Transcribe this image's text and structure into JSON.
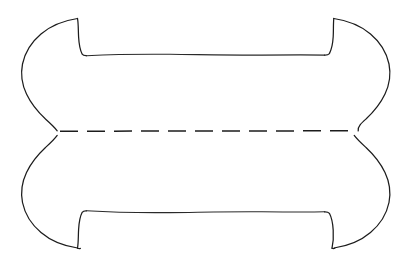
{
  "canvas": {
    "width": 416,
    "height": 271,
    "background_color": "#ffffff",
    "ink_color": "#1c1c1c",
    "stroke_width": 1.25
  },
  "figure": {
    "title": "",
    "symmetry": "bilateral horizontal and vertical",
    "parts": [
      {
        "name": "upper-lobe",
        "label": "Upper lobe outline",
        "ink_color": "#1c1c1c",
        "path": "M 77 18 C 60 21 44 31 33 46 C 23 60 20 70 22 80 C 24 94 32 108 43 118 C 49 124 54 128 57 131 C 54 133 50 135 45 139 C 36 147 29 156 26 165 L 27 166 C 31 154 39 143 49 136 C 53 133 56 131 58 130 L 358 130 C 360 131 363 133 367 136 C 377 143 385 154 389 166 L 390 165 C 387 156 380 147 371 139 C 366 135 362 133 359 131 C 362 128 367 124 373 118 C 384 108 392 94 394 80 C 396 70 393 60 383 46 C 372 31 356 21 339 18 L 338 19 C 340 23 340 30 339 37 C 338 44 336 50 334 54 L 333 55 L 250 55 L 170 55 L 110 55 L 82 55 C 80 51 78 45 77 38 C 76 31 76 23 78 19 Z"
      },
      {
        "name": "upper-left-horn",
        "label": "Upper left horn tip",
        "tip_x": 77,
        "tip_y": 18
      },
      {
        "name": "upper-right-horn",
        "label": "Upper right horn tip",
        "tip_x": 333,
        "tip_y": 18
      },
      {
        "name": "upper-inner-edge",
        "label": "Upper inner horizontal edge",
        "y": 55
      },
      {
        "name": "lower-lobe",
        "label": "Lower lobe outline",
        "ink_color": "#1c1c1c",
        "path": "M 79 248 C 62 245 46 235 35 220 C 25 206 22 196 24 186 C 26 172 34 158 45 148 C 51 142 56 138 59 135 L 357 135 C 360 138 365 142 371 148 C 382 158 390 172 392 186 C 394 196 391 206 381 220 C 370 235 354 245 337 248 L 336 247 C 338 243 338 236 337 229 C 336 222 334 216 332 212 L 331 211 L 250 211 L 170 211 L 110 211 L 84 211 C 82 215 80 221 79 228 C 78 235 78 243 80 247 Z"
      },
      {
        "name": "lower-left-horn",
        "label": "Lower left horn tip",
        "tip_x": 79,
        "tip_y": 248
      },
      {
        "name": "lower-right-horn",
        "label": "Lower right horn tip",
        "tip_x": 331,
        "tip_y": 248
      },
      {
        "name": "lower-inner-edge",
        "label": "Lower inner horizontal edge",
        "y": 213
      },
      {
        "name": "waist-dashed-line",
        "label": "Hidden waist contour (dashed)",
        "y": 131,
        "x_start": 60,
        "x_end": 356,
        "dash_length": 18,
        "gap_length": 9,
        "stroke_width": 1.5,
        "ink_color": "#1c1c1c"
      },
      {
        "name": "left-waist-pinch",
        "label": "Left waist pinch point",
        "x": 57,
        "y": 131
      },
      {
        "name": "right-waist-pinch",
        "label": "Right waist pinch point",
        "x": 358,
        "y": 131
      },
      {
        "name": "left-bulge-extreme",
        "label": "Leftmost outer bulge point",
        "x": 22,
        "y": 80
      },
      {
        "name": "right-bulge-extreme",
        "label": "Rightmost outer bulge point",
        "x": 394,
        "y": 84
      }
    ]
  }
}
